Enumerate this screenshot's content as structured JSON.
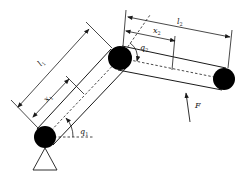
{
  "diagram": {
    "colors": {
      "background": "#ffffff",
      "stroke": "#1a1a1a",
      "joint_fill": "#000000"
    },
    "labels": {
      "l1": {
        "main": "l",
        "sub": "1"
      },
      "x1": {
        "main": "x",
        "sub": "1"
      },
      "q1": {
        "main": "q",
        "sub": "1"
      },
      "l2": {
        "main": "l",
        "sub": "2"
      },
      "x2": {
        "main": "x",
        "sub": "2"
      },
      "q2": {
        "main": "q",
        "sub": "2"
      },
      "force": "F"
    },
    "joints": [
      {
        "name": "base-joint",
        "cx": 45,
        "cy": 137,
        "r": 11
      },
      {
        "name": "elbow-joint",
        "cx": 120,
        "cy": 58,
        "r": 12
      },
      {
        "name": "end-joint",
        "cx": 224,
        "cy": 79,
        "r": 11
      }
    ],
    "icons": {
      "support": "triangle-support-icon",
      "force_arrow": "arrow-up-icon"
    }
  }
}
